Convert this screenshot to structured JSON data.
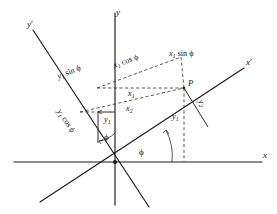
{
  "figure": {
    "background_color": "#ffffff",
    "line_color": "#1a1a1a",
    "dash_color": "#3a3a3a"
  },
  "axes": [
    {
      "id": "y",
      "label": "y",
      "prime": false,
      "kind": "original",
      "orientation": "vertical"
    },
    {
      "id": "x",
      "label": "x",
      "prime": false,
      "kind": "original",
      "orientation": "horizontal"
    },
    {
      "id": "yprime",
      "label": "y",
      "prime": true,
      "kind": "rotated",
      "orientation": "rotated-vertical"
    },
    {
      "id": "xprime",
      "label": "x",
      "prime": true,
      "kind": "rotated",
      "orientation": "rotated-horizontal"
    }
  ],
  "point": {
    "label": "P",
    "description": "point whose coordinates are expressed in both frames"
  },
  "angles": [
    {
      "id": "phi-xaxis",
      "label": "ϕ",
      "between": "x-axis and x'-axis"
    },
    {
      "id": "phi-yaxis",
      "label": "ϕ",
      "between": "y-axis and y'-axis"
    }
  ],
  "component_labels": [
    {
      "id": "x1",
      "base": "x",
      "subscript": "1"
    },
    {
      "id": "x2",
      "base": "x",
      "subscript": "2"
    },
    {
      "id": "y1a",
      "base": "y",
      "subscript": "1"
    },
    {
      "id": "y1b",
      "base": "y",
      "subscript": "1"
    },
    {
      "id": "y2",
      "base": "y",
      "subscript": "2"
    }
  ],
  "projection_labels": [
    {
      "id": "x1-cos-phi",
      "base": "x",
      "subscript": "1",
      "func": "cos",
      "arg": "ϕ",
      "text": "x₁ cos ϕ"
    },
    {
      "id": "x1-sin-phi",
      "base": "x",
      "subscript": "1",
      "func": "sin",
      "arg": "ϕ",
      "text": "x₁ sin ϕ"
    },
    {
      "id": "y1-sin-phi",
      "base": "y",
      "subscript": "1",
      "func": "sin",
      "arg": "ϕ",
      "text": "y₁ sin ϕ"
    },
    {
      "id": "y1-cos-phi",
      "base": "y",
      "subscript": "1",
      "func": "cos",
      "arg": "ϕ",
      "text": "y₁ cos ϕ"
    }
  ],
  "text": {
    "axis_x": "x",
    "axis_y": "y",
    "axis_x_prime": "x",
    "axis_y_prime": "y",
    "prime_mark": "′",
    "point_P": "P",
    "phi": "ϕ",
    "cos": "cos",
    "sin": "sin",
    "sub_1": "1",
    "sub_2": "2"
  }
}
